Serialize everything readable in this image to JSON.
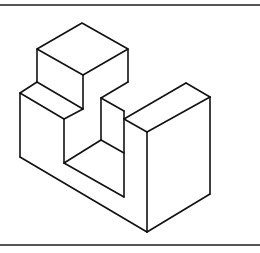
{
  "figure": {
    "line_color": "#111111",
    "frame_color": "#555555",
    "background": "#ffffff"
  }
}
